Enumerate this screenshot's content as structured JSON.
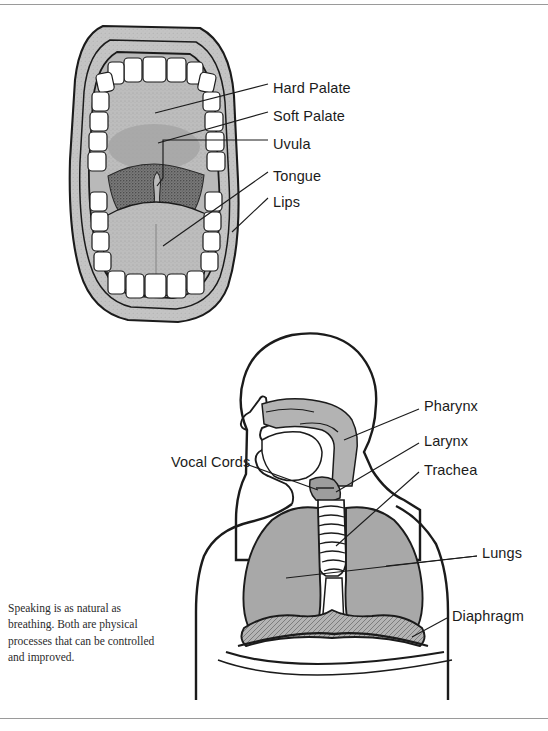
{
  "figure": {
    "caption": "Speaking is as natural as breathing. Both are physical processes that can be controlled and improved."
  },
  "mouth_diagram": {
    "name": "open-mouth-anterior-view",
    "labels": [
      {
        "id": "hard-palate",
        "text": "Hard Palate",
        "x": 273,
        "y": 80
      },
      {
        "id": "soft-palate",
        "text": "Soft Palate",
        "x": 273,
        "y": 108
      },
      {
        "id": "uvula",
        "text": "Uvula",
        "x": 273,
        "y": 136
      },
      {
        "id": "tongue",
        "text": "Tongue",
        "x": 273,
        "y": 168
      },
      {
        "id": "lips",
        "text": "Lips",
        "x": 273,
        "y": 194
      }
    ]
  },
  "torso_diagram": {
    "name": "head-and-chest-profile-view",
    "labels": [
      {
        "id": "pharynx",
        "text": "Pharynx",
        "x": 424,
        "y": 405
      },
      {
        "id": "larynx",
        "text": "Larynx",
        "x": 424,
        "y": 440
      },
      {
        "id": "trachea",
        "text": "Trachea",
        "x": 424,
        "y": 469
      },
      {
        "id": "vocal-cords",
        "text": "Vocal Cords",
        "x": 171,
        "y": 461
      },
      {
        "id": "lungs",
        "text": "Lungs",
        "x": 482,
        "y": 552
      },
      {
        "id": "diaphragm",
        "text": "Diaphragm",
        "x": 452,
        "y": 615
      }
    ]
  },
  "palette": {
    "ink": "#1b1b1b",
    "rule": "#9a9a9a",
    "flesh_light": "#c2c2c2",
    "flesh_mid": "#b0b0b0",
    "palate": "#b8b8b8",
    "throat_dark": "#6f6f6f",
    "tongue": "#b5b5b5",
    "lung": "#a8a8a8",
    "tooth": "#ffffff",
    "page": "#ffffff"
  }
}
